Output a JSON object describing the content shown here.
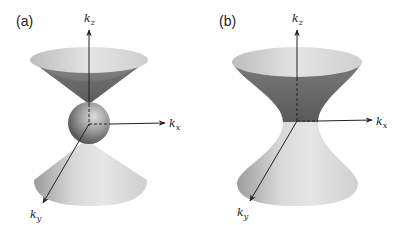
{
  "figure": {
    "panels": [
      {
        "id": "a",
        "label": "(a)",
        "description": "Two cones touching a sphere at the origin (type-I / closed sphere between cone tips)",
        "axes": {
          "kz": {
            "base": "k",
            "sub": "z"
          },
          "kx": {
            "base": "k",
            "sub": "x"
          },
          "ky": {
            "base": "k",
            "sub": "y"
          }
        }
      },
      {
        "id": "b",
        "label": "(b)",
        "description": "Hyperboloid of one sheet (hourglass surface) centered at origin",
        "axes": {
          "kz": {
            "base": "k",
            "sub": "z"
          },
          "kx": {
            "base": "k",
            "sub": "x"
          },
          "ky": {
            "base": "k",
            "sub": "y"
          }
        }
      }
    ],
    "colors": {
      "cone_inner_dark": "#6e6e6e",
      "cone_rim": "#d6d6d6",
      "cone_outer_light": "#e2e2e2",
      "sphere": "#9a9a9a",
      "axis": "#222222"
    }
  }
}
